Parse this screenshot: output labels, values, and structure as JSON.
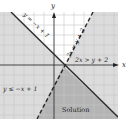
{
  "diagram": {
    "type": "inequality-graph",
    "axes": {
      "x_label": "x",
      "y_label": "y"
    },
    "lines": [
      {
        "id": "solid",
        "equation_label": "y = −x + 1",
        "style": "solid"
      },
      {
        "id": "dashed",
        "equation_label": "2x = y + 2",
        "style": "dashed"
      }
    ],
    "region_labels": {
      "inequality_1": "y ≤ −x + 1",
      "inequality_2": "2x > y + 2",
      "solution": "Solution"
    },
    "colors": {
      "background": "#ffffff",
      "grid": "#c8c8c8",
      "shade_light": "#dcdcdc",
      "shade_dark": "#b4b4b4",
      "line": "#2a2a2a"
    }
  }
}
